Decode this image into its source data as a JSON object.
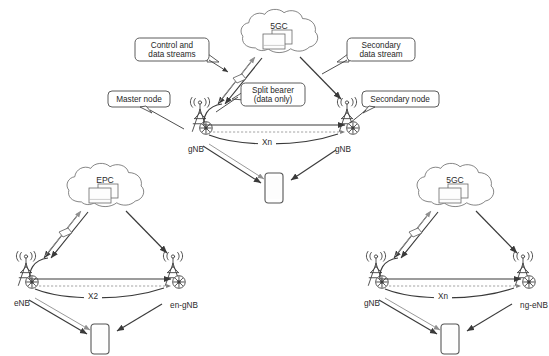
{
  "figure": {
    "background": "#ffffff",
    "line_color": "#3a3a3a",
    "thin_line_color": "#9a9a9a",
    "text_color": "#2b2b2b"
  },
  "panels": [
    {
      "id": "top",
      "name": "nr-nr-dual-connectivity",
      "core": {
        "label": "5GC",
        "icon": "cloud-icon"
      },
      "nodes": [
        {
          "id": "master",
          "label": "gNB",
          "icon": "base-station-icon"
        },
        {
          "id": "secondary",
          "label": "gNB",
          "icon": "base-station-icon"
        }
      ],
      "interface": {
        "label": "Xn"
      },
      "ue": {
        "icon": "ue-phone-icon"
      },
      "callouts": [
        {
          "id": "control-data",
          "lines": [
            "Control and",
            "data streams"
          ]
        },
        {
          "id": "secondary-data",
          "lines": [
            "Secondary",
            "data stream"
          ]
        },
        {
          "id": "master-node",
          "lines": [
            "Master node"
          ]
        },
        {
          "id": "secondary-node",
          "lines": [
            "Secondary node"
          ]
        },
        {
          "id": "split-bearer",
          "lines": [
            "Split bearer",
            "(data only)"
          ]
        }
      ]
    },
    {
      "id": "bottom-left",
      "name": "en-dc-lte-assisted",
      "core": {
        "label": "EPC",
        "icon": "cloud-icon"
      },
      "nodes": [
        {
          "id": "master",
          "label": "eNB",
          "icon": "base-station-icon"
        },
        {
          "id": "secondary",
          "label": "en-gNB",
          "icon": "base-station-icon"
        }
      ],
      "interface": {
        "label": "X2"
      },
      "ue": {
        "icon": "ue-phone-icon"
      },
      "callouts": []
    },
    {
      "id": "bottom-right",
      "name": "ne-dc-nr-assisted",
      "core": {
        "label": "5GC",
        "icon": "cloud-icon"
      },
      "nodes": [
        {
          "id": "master",
          "label": "gNB",
          "icon": "base-station-icon"
        },
        {
          "id": "secondary",
          "label": "ng-eNB",
          "icon": "base-station-icon"
        }
      ],
      "interface": {
        "label": "Xn"
      },
      "ue": {
        "icon": "ue-phone-icon"
      },
      "callouts": []
    }
  ]
}
